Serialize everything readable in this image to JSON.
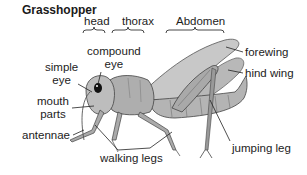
{
  "title": "Grasshopper",
  "segments": {
    "head": "head",
    "thorax": "thorax",
    "abdomen": "Abdomen"
  },
  "labels": {
    "compound_eye_1": "compound",
    "compound_eye_2": "eye",
    "simple_eye_1": "simple",
    "simple_eye_2": "eye",
    "mouth_parts_1": "mouth",
    "mouth_parts_2": "parts",
    "antennae": "antennae",
    "walking_legs": "walking legs",
    "jumping_leg": "jumping leg",
    "forewing": "forewing",
    "hind_wing": "hind wing"
  }
}
